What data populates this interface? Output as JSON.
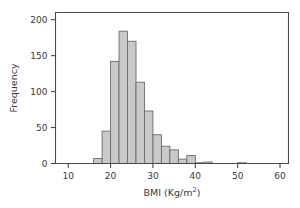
{
  "chart_data": {
    "type": "bar",
    "title": "",
    "subtitle": "",
    "xlabel": "BMI (Kg/m2)",
    "xlabel_base": "BMI (Kg/m",
    "xlabel_sup": "2",
    "xlabel_close": ")",
    "ylabel": "Frequency",
    "xlim": [
      7,
      62
    ],
    "ylim": [
      0,
      210
    ],
    "grid": false,
    "legend": null,
    "bin_width": 2,
    "bin_starts": [
      16,
      18,
      20,
      22,
      24,
      26,
      28,
      30,
      32,
      34,
      36,
      38,
      40,
      42,
      44,
      46,
      48,
      50
    ],
    "categories": [
      "16-18",
      "18-20",
      "20-22",
      "22-24",
      "24-26",
      "26-28",
      "28-30",
      "30-32",
      "32-34",
      "34-36",
      "36-38",
      "38-40",
      "40-42",
      "42-44",
      "44-46",
      "46-48",
      "48-50",
      "50-52"
    ],
    "values": [
      7,
      45,
      142,
      184,
      170,
      113,
      73,
      40,
      24,
      19,
      6,
      11,
      1,
      2,
      0,
      0,
      0,
      1
    ],
    "xticks": [
      10,
      20,
      30,
      40,
      50,
      60
    ],
    "xtick_labels": [
      "10",
      "20",
      "30",
      "40",
      "50",
      "60"
    ],
    "yticks": [
      0,
      50,
      100,
      150,
      200
    ],
    "ytick_labels": [
      "0",
      "50",
      "100",
      "150",
      "200"
    ],
    "bar_fill": "#c9c9c9",
    "bar_stroke": "#6b6b6b",
    "axis_color": "#4a4a4a",
    "background": "#ffffff"
  }
}
